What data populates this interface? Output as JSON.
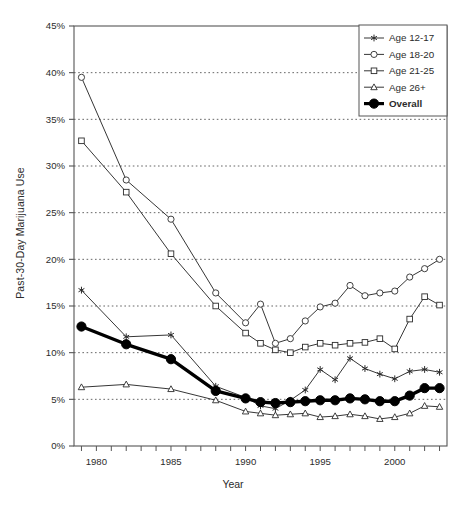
{
  "chart_data": {
    "type": "line",
    "title": "",
    "xlabel": "Year",
    "ylabel": "Past-30-Day Marijuana Use",
    "xlim": [
      1978.5,
      2003.5
    ],
    "ylim": [
      0,
      45
    ],
    "ytick_labels": [
      "0%",
      "5%",
      "10%",
      "15%",
      "20%",
      "25%",
      "30%",
      "35%",
      "40%",
      "45%"
    ],
    "ytick_values": [
      0,
      5,
      10,
      15,
      20,
      25,
      30,
      35,
      40,
      45
    ],
    "xtick_labels": [
      "1980",
      "1985",
      "1990",
      "1995",
      "2000"
    ],
    "xtick_values": [
      1980,
      1985,
      1990,
      1995,
      2000
    ],
    "grid": "horizontal-dotted",
    "legend_position": "top-right",
    "units": "percent",
    "series": [
      {
        "name": "Age 12-17",
        "marker": "asterisk",
        "x": [
          1979,
          1982,
          1985,
          1988,
          1990,
          1991,
          1992,
          1993,
          1994,
          1995,
          1996,
          1997,
          1998,
          1999,
          2000,
          2001,
          2002,
          2003
        ],
        "values": [
          16.7,
          11.7,
          11.9,
          6.4,
          5.2,
          4.3,
          4.0,
          4.9,
          6.0,
          8.2,
          7.1,
          9.4,
          8.3,
          7.7,
          7.2,
          8.0,
          8.2,
          7.9
        ]
      },
      {
        "name": "Age 18-20",
        "marker": "circle",
        "x": [
          1979,
          1982,
          1985,
          1988,
          1990,
          1991,
          1992,
          1993,
          1994,
          1995,
          1996,
          1997,
          1998,
          1999,
          2000,
          2001,
          2002,
          2003
        ],
        "values": [
          39.5,
          28.5,
          24.3,
          16.4,
          13.2,
          15.2,
          11.0,
          11.5,
          13.4,
          14.9,
          15.3,
          17.2,
          16.1,
          16.4,
          16.6,
          18.1,
          19.0,
          20.0
        ]
      },
      {
        "name": "Age 21-25",
        "marker": "square",
        "x": [
          1979,
          1982,
          1985,
          1988,
          1990,
          1991,
          1992,
          1993,
          1994,
          1995,
          1996,
          1997,
          1998,
          1999,
          2000,
          2001,
          2002,
          2003
        ],
        "values": [
          32.7,
          27.2,
          20.6,
          15.0,
          12.1,
          11.0,
          10.3,
          10.0,
          10.6,
          11.0,
          10.8,
          11.0,
          11.1,
          11.5,
          10.4,
          13.6,
          16.0,
          15.1
        ]
      },
      {
        "name": "Age 26+",
        "marker": "triangle",
        "x": [
          1979,
          1982,
          1985,
          1988,
          1990,
          1991,
          1992,
          1993,
          1994,
          1995,
          1996,
          1997,
          1998,
          1999,
          2000,
          2001,
          2002,
          2003
        ],
        "values": [
          6.3,
          6.6,
          6.1,
          4.9,
          3.7,
          3.5,
          3.3,
          3.4,
          3.5,
          3.1,
          3.2,
          3.4,
          3.2,
          2.9,
          3.1,
          3.5,
          4.3,
          4.2
        ]
      },
      {
        "name": "Overall",
        "marker": "filled-circle",
        "emphasis": true,
        "x": [
          1979,
          1982,
          1985,
          1988,
          1990,
          1991,
          1992,
          1993,
          1994,
          1995,
          1996,
          1997,
          1998,
          1999,
          2000,
          2001,
          2002,
          2003
        ],
        "values": [
          12.8,
          10.9,
          9.3,
          5.9,
          5.1,
          4.7,
          4.6,
          4.7,
          4.8,
          4.9,
          4.9,
          5.1,
          5.0,
          4.8,
          4.8,
          5.4,
          6.2,
          6.2
        ]
      }
    ]
  },
  "legend": {
    "entries": [
      {
        "label": "Age 12-17",
        "marker": "asterisk"
      },
      {
        "label": "Age 18-20",
        "marker": "circle"
      },
      {
        "label": "Age 21-25",
        "marker": "square"
      },
      {
        "label": "Age 26+",
        "marker": "triangle"
      },
      {
        "label": "Overall",
        "marker": "filled-circle"
      }
    ]
  },
  "colors": {
    "line": "#2b2b2b",
    "emphasis": "#000000",
    "grid": "#555555",
    "axis": "#555555",
    "background": "#ffffff"
  }
}
